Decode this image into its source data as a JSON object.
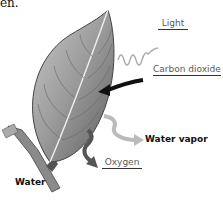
{
  "text_fragment": "en.",
  "labels": {
    "light": "Light",
    "carbon_dioxide": "Carbon dioxide",
    "water_vapor": "Water vapor",
    "oxygen": "Oxygen",
    "water": "Water"
  }
}
